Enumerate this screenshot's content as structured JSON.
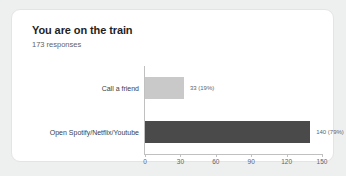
{
  "card": {
    "title": "You are on the train",
    "subtitle": "173 responses"
  },
  "chart_data": {
    "type": "bar",
    "orientation": "horizontal",
    "title": "You are on the train",
    "subtitle": "173 responses",
    "total_responses": 173,
    "categories": [
      "Call a friend",
      "Open Spotify/Netflix/Youtube"
    ],
    "values": [
      33,
      140
    ],
    "data_labels": [
      "33 (19%)",
      "140 (79%)"
    ],
    "colors": [
      "#c9c9c9",
      "#4a4a4a"
    ],
    "xlabel": "",
    "ylabel": "",
    "xlim": [
      0,
      150
    ],
    "tick_labels": [
      "0",
      "30",
      "60",
      "90",
      "120",
      "150"
    ],
    "tick_values": [
      0,
      30,
      60,
      90,
      120,
      150
    ],
    "grid": false,
    "legend": false
  },
  "theme": {
    "page_background": "#eef0ef",
    "card_background": "#ffffff",
    "card_border": "#e4e4e4",
    "axis_color": "#c0c0c0",
    "title_color": "#1f1f1f",
    "muted_text": "#5f6368"
  }
}
